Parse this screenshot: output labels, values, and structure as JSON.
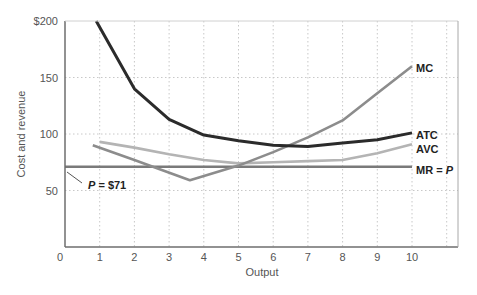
{
  "chart_data": {
    "type": "line",
    "title": "",
    "xlabel": "Output",
    "ylabel": "Cost and revenue",
    "xlim": [
      0,
      11.3
    ],
    "ylim": [
      0,
      200
    ],
    "x_ticks": [
      "0",
      "1",
      "2",
      "3",
      "4",
      "5",
      "6",
      "7",
      "8",
      "9",
      "10"
    ],
    "y_ticks": [
      "50",
      "100",
      "150",
      "$200"
    ],
    "grid": true,
    "legend_position": "inline labels at right end of curves",
    "series": [
      {
        "name": "ATC",
        "label": "ATC",
        "color": "#2b2b2b",
        "x": [
          0.9,
          2,
          3,
          4,
          5,
          6,
          7,
          8,
          9,
          10
        ],
        "y": [
          200,
          140,
          113,
          99,
          94,
          90,
          89,
          92,
          95,
          101
        ]
      },
      {
        "name": "AVC",
        "label": "AVC",
        "color": "#b4b4b4",
        "x": [
          1,
          2,
          3,
          4,
          5,
          6,
          7,
          8,
          9,
          10
        ],
        "y": [
          93,
          88,
          82,
          77,
          74,
          75,
          76,
          77,
          83,
          91
        ]
      },
      {
        "name": "MC",
        "label": "MC",
        "color": "#8c8c8c",
        "x": [
          0.8,
          2,
          3.6,
          5,
          6,
          7,
          8,
          9,
          10
        ],
        "y": [
          90,
          77,
          59,
          72,
          84,
          97,
          112,
          136,
          160
        ]
      },
      {
        "name": "MR = P",
        "label_main": "MR = ",
        "label_italic": "P",
        "color": "#7a7a7a",
        "x": [
          0,
          10
        ],
        "y": [
          71,
          71
        ]
      }
    ],
    "annotations": [
      {
        "text_italic": "P",
        "text": " = $71",
        "x": 1,
        "y": 60,
        "points_to": [
          0,
          71
        ]
      }
    ]
  }
}
